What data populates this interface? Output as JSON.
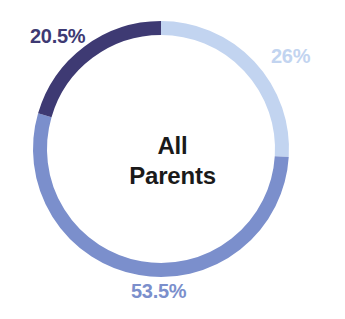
{
  "chart_data": {
    "type": "pie",
    "variant": "donut",
    "title": "All Parents",
    "center_text_lines": [
      "All",
      "Parents"
    ],
    "xlabel": "",
    "ylabel": "",
    "legend_position": "none",
    "grid": false,
    "total": 100,
    "units": "percent",
    "start_angle_deg": 0,
    "direction": "clockwise",
    "categories": [
      "26%",
      "53.5%",
      "20.5%"
    ],
    "values": [
      26,
      53.5,
      20.5
    ],
    "labels": [
      "26%",
      "53.5%",
      "20.5%"
    ],
    "colors": [
      "#c2d4f0",
      "#7b8fcc",
      "#3e3a73"
    ],
    "slices": [
      {
        "label": "26%",
        "value": 26,
        "color": "#c2d4f0",
        "start_deg": 0,
        "end_deg": 93.6,
        "label_position": "right"
      },
      {
        "label": "53.5%",
        "value": 53.5,
        "color": "#7b8fcc",
        "start_deg": 93.6,
        "end_deg": 286.2,
        "label_position": "bottom"
      },
      {
        "label": "20.5%",
        "value": 20.5,
        "color": "#3e3a73",
        "start_deg": 286.2,
        "end_deg": 360,
        "label_position": "top-left"
      }
    ]
  },
  "geometry": {
    "center_x": 161,
    "center_y": 149,
    "radius": 121,
    "stroke_width": 14
  },
  "palette": {
    "background": "#ffffff",
    "light_blue": "#c2d4f0",
    "medium_blue": "#7b8fcc",
    "dark_navy": "#3e3a73",
    "center_text": "#1a1a1a"
  },
  "center": {
    "line1": "All",
    "line2": "Parents"
  },
  "labels": {
    "dark": "20.5%",
    "light": "26%",
    "medium": "53.5%"
  }
}
